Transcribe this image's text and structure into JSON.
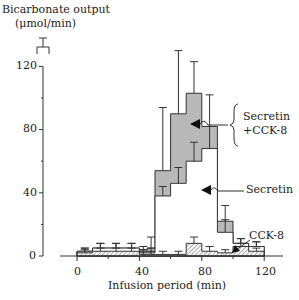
{
  "chart_data": {
    "type": "bar",
    "style": "step histogram (stacked overlay) with error bars",
    "title": "",
    "ylabel": "Bicarbonate output (μmol/min)",
    "ylabel_line1": "Bicarbonate output",
    "ylabel_line2": "(μmol/min)",
    "xlabel": "Infusion period (min)",
    "xlim": [
      -10,
      120
    ],
    "ylim": [
      0,
      120
    ],
    "xticks": [
      0,
      40,
      80,
      120
    ],
    "yticks": [
      0,
      40,
      80,
      120
    ],
    "grid": false,
    "bin_edges": [
      0,
      10,
      20,
      30,
      40,
      45,
      50,
      60,
      70,
      80,
      90,
      100,
      110,
      120
    ],
    "series": [
      {
        "name": "Secretin +CCK-8",
        "fill": "#b8b8b8",
        "values": [
          3,
          5,
          5,
          5,
          4,
          5,
          54,
          90,
          103,
          82,
          22,
          8,
          6
        ],
        "errors": [
          2,
          3,
          3,
          3,
          2,
          7,
          40,
          40,
          20,
          20,
          10,
          3,
          3
        ]
      },
      {
        "name": "Secretin",
        "fill": "#ffffff",
        "values": [
          3,
          5,
          5,
          5,
          2,
          2,
          38,
          46,
          60,
          68,
          15,
          8,
          6
        ],
        "errors": [
          2,
          3,
          3,
          3,
          2,
          3,
          6,
          10,
          12,
          14,
          8,
          3,
          3
        ]
      },
      {
        "name": "CCK-8",
        "fill": "hatched",
        "values": [
          2,
          3,
          3,
          3,
          1,
          1,
          1,
          1,
          8,
          3,
          2,
          6,
          3
        ],
        "errors": [
          2,
          2,
          2,
          2,
          2,
          2,
          2,
          2,
          4,
          3,
          2,
          2,
          2
        ]
      }
    ],
    "pre_infusion_marker": {
      "x": -10,
      "value": "bracket above axis"
    },
    "annotations": [
      {
        "text": "Secretin",
        "target": "Secretin series",
        "arrow": true
      },
      {
        "text": "Secretin\n+CCK-8",
        "target": "Secretin +CCK-8 series",
        "arrow": true,
        "brace": true
      },
      {
        "text": "CCK-8",
        "target": "CCK-8 series",
        "arrow": true
      }
    ],
    "legend": "inline annotations on right"
  },
  "labels": {
    "ylabel_line1": "Bicarbonate output",
    "ylabel_line2": "(μmol/min)",
    "xlabel": "Infusion period (min)",
    "ann_combo_1": "Secretin",
    "ann_combo_2": "+CCK-8",
    "ann_secretin": "Secretin",
    "ann_cck": "CCK-8",
    "ytick_0": "0",
    "ytick_40": "40",
    "ytick_80": "80",
    "ytick_120": "120",
    "xtick_0": "0",
    "xtick_40": "40",
    "xtick_80": "80",
    "xtick_120": "120"
  }
}
